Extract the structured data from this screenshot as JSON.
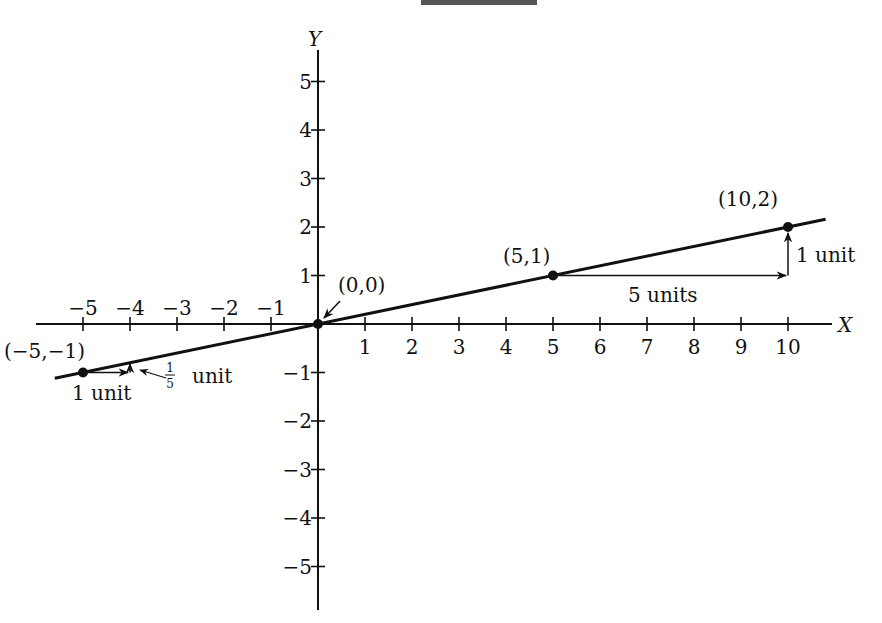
{
  "figure": {
    "axes": {
      "x_label": "X",
      "y_label": "Y",
      "x_ticks": [
        {
          "value": -5,
          "label": "−5"
        },
        {
          "value": -4,
          "label": "−4"
        },
        {
          "value": -3,
          "label": "−3"
        },
        {
          "value": -2,
          "label": "−2"
        },
        {
          "value": -1,
          "label": "−1"
        },
        {
          "value": 1,
          "label": "1"
        },
        {
          "value": 2,
          "label": "2"
        },
        {
          "value": 3,
          "label": "3"
        },
        {
          "value": 4,
          "label": "4"
        },
        {
          "value": 5,
          "label": "5"
        },
        {
          "value": 6,
          "label": "6"
        },
        {
          "value": 7,
          "label": "7"
        },
        {
          "value": 8,
          "label": "8"
        },
        {
          "value": 9,
          "label": "9"
        },
        {
          "value": 10,
          "label": "10"
        }
      ],
      "y_ticks": [
        {
          "value": 5,
          "label": "5"
        },
        {
          "value": 4,
          "label": "4"
        },
        {
          "value": 3,
          "label": "3"
        },
        {
          "value": 2,
          "label": "2"
        },
        {
          "value": 1,
          "label": "1"
        },
        {
          "value": -1,
          "label": "−1"
        },
        {
          "value": -2,
          "label": "−2"
        },
        {
          "value": -3,
          "label": "−3"
        },
        {
          "value": -4,
          "label": "−4"
        },
        {
          "value": -5,
          "label": "−5"
        }
      ]
    },
    "line": {
      "slope": 0.2,
      "intercept": 0,
      "x_from": -5.6,
      "x_to": 10.8
    },
    "points": [
      {
        "x": -5,
        "y": -1,
        "label": "(−5,−1)"
      },
      {
        "x": 0,
        "y": 0,
        "label": "(0,0)"
      },
      {
        "x": 5,
        "y": 1,
        "label": "(5,1)"
      },
      {
        "x": 10,
        "y": 2,
        "label": "(10,2)"
      }
    ],
    "annotations": {
      "run_small": "1 unit",
      "rise_small_num": "1",
      "rise_small_den": "5",
      "rise_small_unit": "unit",
      "run_large": "5 units",
      "rise_large": "1 unit"
    }
  }
}
